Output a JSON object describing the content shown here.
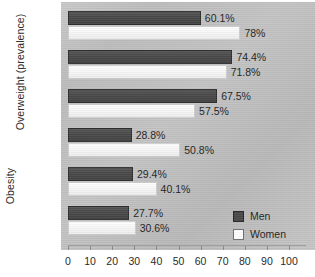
{
  "chart_data": {
    "type": "bar",
    "orientation": "horizontal",
    "title": "",
    "xlabel": "",
    "ylabel": "",
    "xlim": [
      0,
      100
    ],
    "xticks": [
      0,
      10,
      20,
      30,
      40,
      50,
      60,
      70,
      80,
      90,
      100
    ],
    "grid": false,
    "legend": {
      "position": "lower-right",
      "entries": [
        {
          "name": "Men",
          "color": "#4a4a4a"
        },
        {
          "name": "Women",
          "color": "#ffffff"
        }
      ]
    },
    "sections": [
      {
        "label": "Overweight (prevalence)",
        "groups": [
          {
            "category": "Black",
            "bars": [
              {
                "series": "Men",
                "value": 60.1,
                "label": "60.1%"
              },
              {
                "series": "Women",
                "value": 78,
                "label": "78%"
              }
            ]
          },
          {
            "category": "Hispanic",
            "bars": [
              {
                "series": "Men",
                "value": 74.4,
                "label": "74.4%"
              },
              {
                "series": "Women",
                "value": 71.8,
                "label": "71.8%"
              }
            ]
          },
          {
            "category": "White",
            "bars": [
              {
                "series": "Men",
                "value": 67.5,
                "label": "67.5%"
              },
              {
                "series": "Women",
                "value": 57.5,
                "label": "57.5%"
              }
            ]
          }
        ]
      },
      {
        "label": "Obesity",
        "groups": [
          {
            "category": "Black",
            "bars": [
              {
                "series": "Men",
                "value": 28.8,
                "label": "28.8%"
              },
              {
                "series": "Women",
                "value": 50.8,
                "label": "50.8%"
              }
            ]
          },
          {
            "category": "Hispanic",
            "bars": [
              {
                "series": "Men",
                "value": 29.4,
                "label": "29.4%"
              },
              {
                "series": "Women",
                "value": 40.1,
                "label": "40.1%"
              }
            ]
          },
          {
            "category": "White",
            "bars": [
              {
                "series": "Men",
                "value": 27.7,
                "label": "27.7%"
              },
              {
                "series": "Women",
                "value": 30.6,
                "label": "30.6%"
              }
            ]
          }
        ]
      }
    ],
    "categories": [
      "Black",
      "Hispanic",
      "White",
      "Black",
      "Hispanic",
      "White"
    ],
    "series": [
      {
        "name": "Men",
        "values": [
          60.1,
          74.4,
          67.5,
          28.8,
          29.4,
          27.7
        ]
      },
      {
        "name": "Women",
        "values": [
          78,
          71.8,
          57.5,
          50.8,
          40.1,
          30.6
        ]
      }
    ],
    "colors": {
      "men_bar": "#4a4a4a",
      "women_bar": "#ffffff",
      "panel_background": "#c2c2c2",
      "text": "#2b2b2b"
    }
  }
}
